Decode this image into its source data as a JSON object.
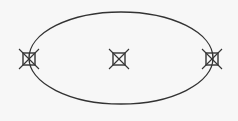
{
  "diagram": {
    "background": "#f7f7f7",
    "stroke_color": "#333333",
    "ellipse": {
      "cx": 121,
      "cy": 58,
      "rx": 92,
      "ry": 46
    },
    "nodes": [
      {
        "id": "left",
        "cx": 29,
        "cy": 59,
        "type": "crossed-square"
      },
      {
        "id": "center",
        "cx": 119,
        "cy": 59,
        "type": "crossed-square"
      },
      {
        "id": "right",
        "cx": 212,
        "cy": 59,
        "type": "crossed-square"
      }
    ]
  }
}
